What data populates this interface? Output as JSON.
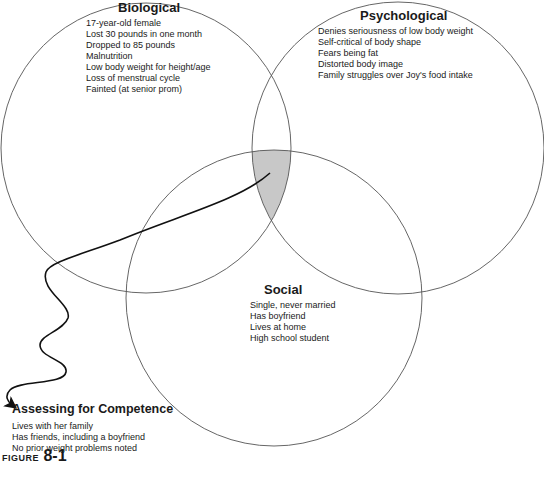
{
  "diagram": {
    "type": "venn",
    "circles": [
      {
        "id": "biological",
        "title": "Biological",
        "items": [
          "17-year-old female",
          "Lost 30 pounds in one month",
          "Dropped to 85 pounds",
          "Malnutrition",
          "Low body weight for height/age",
          "Loss of menstrual cycle",
          "Fainted (at senior prom)"
        ]
      },
      {
        "id": "psychological",
        "title": "Psychological",
        "items": [
          "Denies seriousness of low body weight",
          "Self-critical of body shape",
          "Fears being fat",
          "Distorted body image",
          "Family struggles over Joy's food intake"
        ]
      },
      {
        "id": "social",
        "title": "Social",
        "items": [
          "Single, never married",
          "Has boyfriend",
          "Lives at home",
          "High school student"
        ]
      }
    ],
    "highlighted_intersection": [
      "biological",
      "psychological",
      "social"
    ],
    "highlight_color": "#c8c8c8",
    "callout": {
      "title": "Assessing for Competence",
      "items": [
        "Lives with her family",
        "Has friends, including a boyfriend",
        "No prior weight problems noted"
      ]
    },
    "figure_label": {
      "word": "FIGURE",
      "number": "8-1"
    }
  }
}
